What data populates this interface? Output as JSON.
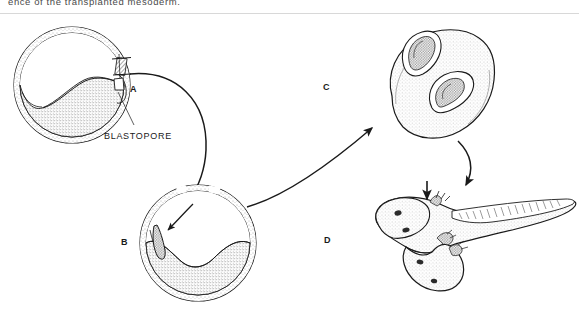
{
  "figure": {
    "caption_fragment": "ence of the transplanted mesoderm.",
    "labels": {
      "a": "A",
      "b": "B",
      "c": "C",
      "d": "D",
      "blastopore": "BLASTOPORE"
    },
    "colors": {
      "ink": "#1a1a1a",
      "stipple": "#6e6e6e",
      "caption": "#4a4a4a",
      "rule": "#d8d8d8",
      "background": "#ffffff"
    },
    "icons": {
      "arrow_a_to_b": "curved-arrow-icon",
      "arrow_b_to_c": "diagonal-arrow-icon",
      "arrow_c_to_d": "curved-arrow-icon",
      "arrow_graft": "inward-arrow-icon",
      "pointer_d": "down-arrow-icon",
      "leader_blastopore": "leader-line-icon"
    },
    "panels": [
      {
        "id": "A",
        "name": "donor-gastrula",
        "description": "Amphibian gastrula in sagittal section with dorsal blastopore lip region marked for excision"
      },
      {
        "id": "B",
        "name": "host-gastrula",
        "description": "Recipient gastrula with transplanted dorsal lip graft implanted on the ventral side"
      },
      {
        "id": "C",
        "name": "neurula-with-secondary-axis",
        "description": "Neurula stage embryo showing primary and induced secondary neural plate"
      },
      {
        "id": "D",
        "name": "conjoined-larva",
        "description": "Larva with induced secondary embryo attached ventrally"
      }
    ]
  }
}
